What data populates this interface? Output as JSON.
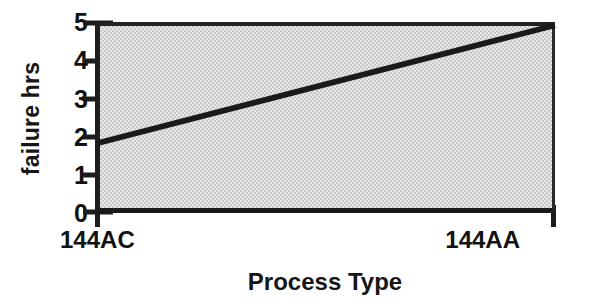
{
  "chart_data": {
    "type": "line",
    "title": "",
    "xlabel": "Process Type",
    "ylabel": "failure hrs",
    "categories": [
      "144AC",
      "144AA"
    ],
    "values": [
      1.8,
      5.0
    ],
    "series": [
      {
        "name": "failure hrs",
        "values": [
          1.8,
          5.0
        ]
      }
    ],
    "ylim": [
      0,
      5
    ],
    "yticks": [
      0,
      1,
      2,
      3,
      4,
      5
    ],
    "ytick_labels": [
      "0",
      "1",
      "2",
      "3",
      "4",
      "5"
    ],
    "xticks": [
      0,
      1
    ],
    "grid": false,
    "legend": false,
    "plot_background_color": "#c9c9c9",
    "line_color": "#1a1a1a",
    "axis_color": "#1c1c1c"
  }
}
